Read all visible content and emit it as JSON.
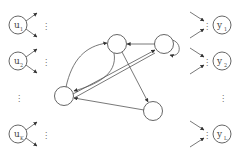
{
  "diagram": {
    "type": "recurrent-network",
    "colors": {
      "stroke": "#555555",
      "text": "#444444",
      "background": "#ffffff"
    },
    "inputs": [
      {
        "id": "u1",
        "base": "u",
        "sub": "1",
        "x": 18,
        "y": 25
      },
      {
        "id": "u2",
        "base": "u",
        "sub": "2",
        "x": 18,
        "y": 61
      },
      {
        "id": "uK",
        "base": "u",
        "sub": "K",
        "x": 18,
        "y": 134
      }
    ],
    "inputs_ellipsis": "⋮",
    "outputs": [
      {
        "id": "y1",
        "base": "y",
        "sub": "1",
        "x": 222,
        "y": 25
      },
      {
        "id": "y2",
        "base": "y",
        "sub": "2",
        "x": 222,
        "y": 61
      },
      {
        "id": "yL",
        "base": "y",
        "sub": "L",
        "x": 222,
        "y": 134
      }
    ],
    "outputs_ellipsis": "⋮",
    "reservoir_nodes": [
      {
        "id": "A",
        "x": 117,
        "y": 44
      },
      {
        "id": "B",
        "x": 164,
        "y": 44
      },
      {
        "id": "C",
        "x": 64,
        "y": 96
      },
      {
        "id": "D",
        "x": 153,
        "y": 111
      }
    ],
    "reservoir_edges": [
      {
        "from": "B",
        "to": "A"
      },
      {
        "from": "C",
        "to": "A",
        "curved": true
      },
      {
        "from": "A",
        "to": "C",
        "curved": true
      },
      {
        "from": "C",
        "to": "B"
      },
      {
        "from": "B",
        "to": "C"
      },
      {
        "from": "A",
        "to": "D"
      },
      {
        "from": "D",
        "to": "C"
      },
      {
        "from": "B",
        "to": "B",
        "self_loop": true
      }
    ]
  }
}
